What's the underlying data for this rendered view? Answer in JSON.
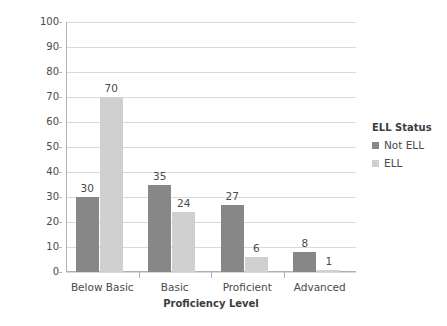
{
  "chart_data": {
    "type": "bar",
    "title": "",
    "subtitle": "",
    "xlabel": "Proficiency Level",
    "ylabel": "Percent at Level",
    "categories": [
      "Below Basic",
      "Basic",
      "Proficient",
      "Advanced"
    ],
    "series": [
      {
        "name": "Not ELL",
        "values": [
          30,
          35,
          27,
          8
        ],
        "color": "#878787"
      },
      {
        "name": "ELL",
        "values": [
          70,
          24,
          6,
          1
        ],
        "color": "#d0d0d0"
      }
    ],
    "ylim": [
      0,
      100
    ],
    "yticks": [
      0,
      10,
      20,
      30,
      40,
      50,
      60,
      70,
      80,
      90,
      100
    ],
    "ytick_labels": [
      "0",
      "10",
      "20",
      "30",
      "40",
      "50",
      "60",
      "70",
      "80",
      "90",
      "100"
    ],
    "grid": true,
    "grid_axis": "y",
    "data_labels": true,
    "legend": {
      "title": "ELL Status",
      "position": "right",
      "entries": [
        "Not ELL",
        "ELL"
      ]
    },
    "plot_background": "#ffffff",
    "gridline_color": "#d9d9d9",
    "axis_color": "#b0b0b0"
  }
}
